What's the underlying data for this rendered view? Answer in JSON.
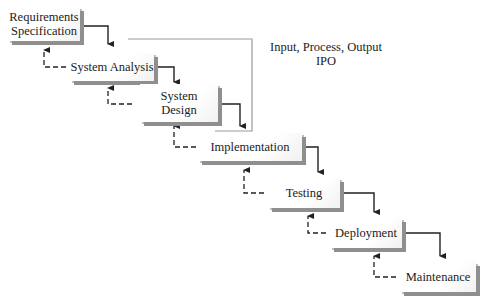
{
  "diagram": {
    "type": "waterfall-software-development-process",
    "stages": [
      {
        "id": "requirements",
        "label": "Requirements Specification",
        "lines": [
          "Requirements",
          "Specification"
        ]
      },
      {
        "id": "analysis",
        "label": "System Analysis",
        "lines": [
          "System Analysis"
        ]
      },
      {
        "id": "design",
        "label": "System Design",
        "lines": [
          "System",
          "Design"
        ]
      },
      {
        "id": "implementation",
        "label": "Implementation",
        "lines": [
          "Implementation"
        ]
      },
      {
        "id": "testing",
        "label": "Testing",
        "lines": [
          "Testing"
        ]
      },
      {
        "id": "deployment",
        "label": "Deployment",
        "lines": [
          "Deployment"
        ]
      },
      {
        "id": "maintenance",
        "label": "Maintenance",
        "lines": [
          "Maintenance"
        ]
      }
    ],
    "annotation": {
      "line1": "Input, Process, Output",
      "line2": "IPO",
      "brackets": [
        "System Analysis",
        "System Design"
      ]
    },
    "connectors": {
      "forward": "solid arrow from each stage to the next",
      "feedback": "dashed arrow from each stage back to the previous"
    },
    "colors": {
      "box_face": "#ffffff",
      "box_shadow": "#8f8f8f",
      "arrow": "#222222",
      "bracket": "#9a9a9a"
    }
  }
}
